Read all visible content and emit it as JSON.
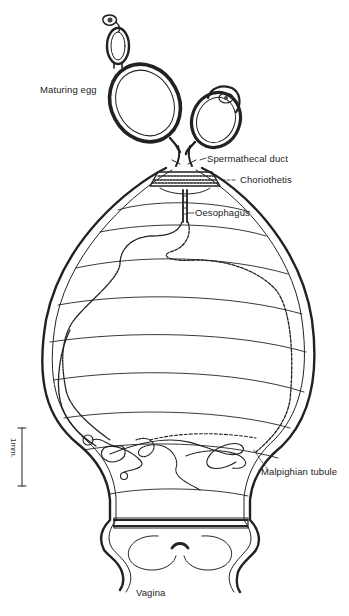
{
  "figure": {
    "labels": {
      "maturing_egg": "Maturing egg",
      "spermathecal_duct": "Spermathecal duct",
      "choriothetis": "Choriothetis",
      "oesophagus": "Oesophagus",
      "malpighian_tubule": "Malpighian tubule",
      "vagina": "Vagina"
    },
    "scale_bar": {
      "label": "1mm.",
      "length_px": 58
    },
    "colors": {
      "ink": "#222222",
      "background": "#ffffff"
    }
  }
}
